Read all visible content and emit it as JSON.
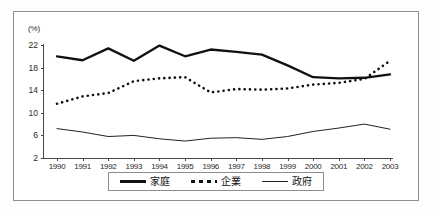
{
  "chart_data": {
    "type": "line",
    "title": "",
    "subtitle": "",
    "xlabel": "",
    "ylabel": "(%)",
    "unit_label": "(%)",
    "grid": false,
    "legend_position": "bottom",
    "x": [
      1990,
      1991,
      1992,
      1993,
      1994,
      1995,
      1996,
      1997,
      1998,
      1999,
      2000,
      2001,
      2002,
      2003
    ],
    "categories": [
      "1990",
      "1991",
      "1992",
      "1993",
      "1994",
      "1995",
      "1996",
      "1997",
      "1998",
      "1999",
      "2000",
      "2001",
      "2002",
      "2003"
    ],
    "xlim": [
      1990,
      2003
    ],
    "ylim": [
      2,
      22
    ],
    "yticks": [
      2,
      6,
      10,
      14,
      18,
      22
    ],
    "ytick_labels": [
      "2",
      "6",
      "10",
      "14",
      "18",
      "22"
    ],
    "series": [
      {
        "name": "家庭",
        "style": "solid-thick",
        "color": "#111111",
        "values": [
          20.0,
          19.3,
          21.4,
          19.2,
          21.9,
          20.0,
          21.2,
          20.8,
          20.3,
          18.4,
          16.3,
          16.1,
          16.2,
          16.8
        ]
      },
      {
        "name": "企業",
        "style": "dotted",
        "color": "#111111",
        "values": [
          11.6,
          12.9,
          13.5,
          15.6,
          16.1,
          16.3,
          13.6,
          14.2,
          14.1,
          14.3,
          15.0,
          15.3,
          16.0,
          19.2
        ]
      },
      {
        "name": "政府",
        "style": "solid-thin",
        "color": "#222222",
        "values": [
          7.2,
          6.6,
          5.8,
          6.0,
          5.4,
          5.0,
          5.5,
          5.6,
          5.3,
          5.8,
          6.7,
          7.3,
          8.0,
          7.1
        ]
      }
    ]
  },
  "legend": {
    "items": [
      {
        "label": "家庭",
        "style": "solid-thick"
      },
      {
        "label": "企業",
        "style": "dotted"
      },
      {
        "label": "政府",
        "style": "solid-thin"
      }
    ]
  }
}
